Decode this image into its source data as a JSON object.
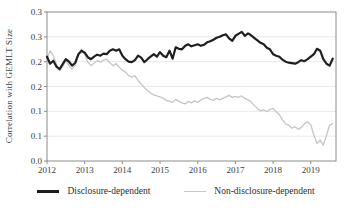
{
  "figure": {
    "background": "#ffffff",
    "text_color": "#3b3b3b",
    "frame_color": "#8c8c8c",
    "gridline_color": "#e9e9e9"
  },
  "chart_data": {
    "type": "line",
    "title": "",
    "xlabel": "",
    "ylabel": "Correlation with GEMLT Size",
    "ylim": [
      0,
      0.3
    ],
    "xlim": [
      2012.0,
      2019.67
    ],
    "grid": "horizontal-only, faint",
    "legend_position": "bottom",
    "x_frequency": "monthly",
    "x_start": 2012.0,
    "x_step": 0.0833333,
    "y_ticks": {
      "values": [
        0.3,
        0.25,
        0.2,
        0.15,
        0.1,
        0.05,
        0.0
      ],
      "labels": [
        "0.3",
        "0.3",
        "0.2",
        "0.2",
        "0.1",
        "0.1",
        "0.0"
      ]
    },
    "x_ticks": {
      "values": [
        2012,
        2013,
        2014,
        2015,
        2016,
        2017,
        2018,
        2019
      ],
      "labels": [
        "2012",
        "2013",
        "2014",
        "2015",
        "2016",
        "2017",
        "2018",
        "2019"
      ]
    },
    "series": [
      {
        "name": "Disclosure-dependent",
        "color": "#1f1f1f",
        "stroke_width": 2.2,
        "values": [
          0.21,
          0.196,
          0.202,
          0.19,
          0.185,
          0.195,
          0.205,
          0.2,
          0.192,
          0.198,
          0.215,
          0.222,
          0.218,
          0.209,
          0.205,
          0.21,
          0.214,
          0.212,
          0.216,
          0.215,
          0.222,
          0.225,
          0.222,
          0.225,
          0.212,
          0.205,
          0.2,
          0.199,
          0.203,
          0.212,
          0.208,
          0.199,
          0.205,
          0.21,
          0.215,
          0.21,
          0.219,
          0.212,
          0.209,
          0.222,
          0.206,
          0.229,
          0.226,
          0.225,
          0.232,
          0.235,
          0.231,
          0.233,
          0.235,
          0.232,
          0.234,
          0.239,
          0.241,
          0.244,
          0.248,
          0.25,
          0.253,
          0.255,
          0.247,
          0.242,
          0.252,
          0.256,
          0.26,
          0.252,
          0.257,
          0.253,
          0.248,
          0.243,
          0.238,
          0.235,
          0.228,
          0.225,
          0.215,
          0.212,
          0.21,
          0.204,
          0.2,
          0.198,
          0.197,
          0.196,
          0.199,
          0.203,
          0.201,
          0.205,
          0.21,
          0.215,
          0.226,
          0.222,
          0.205,
          0.196,
          0.192,
          0.206
        ]
      },
      {
        "name": "Non-disclosure-dependent",
        "color": "#c6c6c6",
        "stroke_width": 1.3,
        "values": [
          0.205,
          0.222,
          0.212,
          0.195,
          0.182,
          0.19,
          0.202,
          0.192,
          0.185,
          0.192,
          0.212,
          0.225,
          0.215,
          0.199,
          0.192,
          0.197,
          0.202,
          0.199,
          0.203,
          0.205,
          0.198,
          0.192,
          0.196,
          0.189,
          0.183,
          0.179,
          0.172,
          0.169,
          0.172,
          0.162,
          0.155,
          0.148,
          0.142,
          0.137,
          0.133,
          0.131,
          0.129,
          0.126,
          0.122,
          0.12,
          0.118,
          0.124,
          0.12,
          0.117,
          0.115,
          0.12,
          0.117,
          0.121,
          0.118,
          0.123,
          0.126,
          0.128,
          0.124,
          0.122,
          0.126,
          0.123,
          0.126,
          0.129,
          0.132,
          0.128,
          0.13,
          0.128,
          0.131,
          0.126,
          0.123,
          0.119,
          0.112,
          0.106,
          0.101,
          0.103,
          0.099,
          0.104,
          0.106,
          0.099,
          0.093,
          0.083,
          0.075,
          0.072,
          0.066,
          0.069,
          0.064,
          0.067,
          0.075,
          0.079,
          0.073,
          0.052,
          0.035,
          0.042,
          0.032,
          0.052,
          0.072,
          0.075
        ]
      }
    ]
  }
}
